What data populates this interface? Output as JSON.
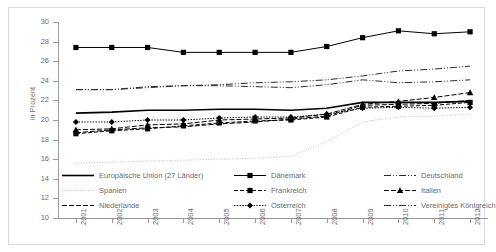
{
  "axis": {
    "ylabel": "in Prozent",
    "yticks": [
      "30",
      "28",
      "26",
      "24",
      "22",
      "20",
      "18",
      "16",
      "14",
      "12",
      "10"
    ],
    "xticks": [
      "2001",
      "2002",
      "2003",
      "2004",
      "2005",
      "2006",
      "2007",
      "2008",
      "2009",
      "2010",
      "2011",
      "2012"
    ]
  },
  "legend": {
    "items": [
      {
        "label": "Europäische Union (27 Länder)",
        "key": "solid-thick",
        "col": 0,
        "row": 0
      },
      {
        "label": "Dänemark",
        "key": "solid-square",
        "col": 1,
        "row": 0
      },
      {
        "label": "Deutschland",
        "key": "dashdotdot",
        "col": 2,
        "row": 0
      },
      {
        "label": "Spanien",
        "key": "dotted-light",
        "col": 0,
        "row": 1
      },
      {
        "label": "Frankreich",
        "key": "dashed-square",
        "col": 1,
        "row": 1
      },
      {
        "label": "Italien",
        "key": "dashed-triangle",
        "col": 2,
        "row": 1
      },
      {
        "label": "Niederlande",
        "key": "dashed",
        "col": 0,
        "row": 2
      },
      {
        "label": "Österreich",
        "key": "dotted-diamond",
        "col": 1,
        "row": 2
      },
      {
        "label": "Vereinigtes Königreich",
        "key": "dashdotdot",
        "col": 2,
        "row": 2
      }
    ]
  },
  "chart_data": {
    "type": "line",
    "title": "",
    "xlabel": "",
    "ylabel": "in Prozent",
    "x": [
      2001,
      2002,
      2003,
      2004,
      2005,
      2006,
      2007,
      2008,
      2009,
      2010,
      2011,
      2012
    ],
    "ylim": [
      10,
      30
    ],
    "ytick_step": 2,
    "grid": false,
    "legend_position": "bottom",
    "series": [
      {
        "name": "Europäische Union (27 Länder)",
        "style": "solid-thick",
        "values": [
          20.7,
          20.8,
          21.0,
          21.0,
          21.1,
          21.1,
          21.0,
          21.2,
          21.8,
          21.8,
          21.8,
          21.9
        ]
      },
      {
        "name": "Dänemark",
        "style": "solid-square",
        "marker": "square",
        "values": [
          27.4,
          27.4,
          27.4,
          26.9,
          26.9,
          26.9,
          26.9,
          27.5,
          28.4,
          29.1,
          28.8,
          29.0
        ]
      },
      {
        "name": "Deutschland",
        "style": "dashdotdot",
        "values": [
          23.1,
          23.1,
          23.4,
          23.5,
          23.5,
          23.4,
          23.3,
          23.6,
          24.1,
          23.8,
          23.9,
          24.1
        ]
      },
      {
        "name": "Spanien",
        "style": "dotted-light",
        "values": [
          15.6,
          15.7,
          15.8,
          15.9,
          16.0,
          16.1,
          16.3,
          17.8,
          19.8,
          20.3,
          20.4,
          20.6
        ]
      },
      {
        "name": "Frankreich",
        "style": "dashed-square",
        "marker": "square",
        "values": [
          18.6,
          18.9,
          19.1,
          19.4,
          19.7,
          19.9,
          20.0,
          20.3,
          21.3,
          21.4,
          21.5,
          21.8
        ]
      },
      {
        "name": "Italien",
        "style": "dashed-triangle",
        "marker": "triangle",
        "values": [
          19.0,
          19.1,
          19.5,
          19.6,
          20.0,
          20.1,
          20.2,
          20.6,
          21.6,
          21.9,
          22.3,
          22.8
        ]
      },
      {
        "name": "Niederlande",
        "style": "dashed",
        "values": [
          18.7,
          19.0,
          19.2,
          19.3,
          19.6,
          19.8,
          20.1,
          20.4,
          21.5,
          21.6,
          21.7,
          22.0
        ]
      },
      {
        "name": "Österreich",
        "style": "dotted-diamond",
        "marker": "diamond",
        "values": [
          19.8,
          19.8,
          20.0,
          20.0,
          20.2,
          20.3,
          20.3,
          20.6,
          21.2,
          21.3,
          21.2,
          21.3
        ]
      },
      {
        "name": "Vereinigtes Königreich",
        "style": "dashdotdot",
        "values": [
          23.1,
          23.1,
          23.3,
          23.5,
          23.6,
          23.8,
          23.9,
          24.1,
          24.5,
          25.0,
          25.2,
          25.5
        ]
      }
    ]
  }
}
